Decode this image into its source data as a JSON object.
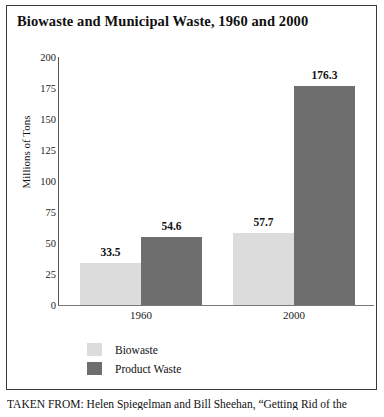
{
  "chart_data": {
    "type": "bar",
    "title": "Biowaste and Municipal Waste, 1960 and 2000",
    "xlabel": "",
    "ylabel": "Millions of Tons",
    "categories": [
      "1960",
      "2000"
    ],
    "series": [
      {
        "name": "Biowaste",
        "values": [
          33.5,
          57.7
        ],
        "color": "#dcdcdc"
      },
      {
        "name": "Product Waste",
        "values": [
          54.6,
          176.3
        ],
        "color": "#6e6e6e"
      }
    ],
    "ylim": [
      0,
      200
    ],
    "yticks": [
      200,
      175,
      150,
      125,
      100,
      75,
      50,
      25,
      0
    ],
    "grid": false,
    "legend_position": "bottom-left",
    "data_labels": [
      "33.5",
      "54.6",
      "57.7",
      "176.3"
    ]
  },
  "legend": {
    "items": [
      {
        "label": "Biowaste",
        "color": "#dcdcdc"
      },
      {
        "label": "Product Waste",
        "color": "#6e6e6e"
      }
    ]
  },
  "source": {
    "caption": "TAKEN FROM: Helen Spiegelman and Bill Sheehan, “Getting Rid of the"
  }
}
